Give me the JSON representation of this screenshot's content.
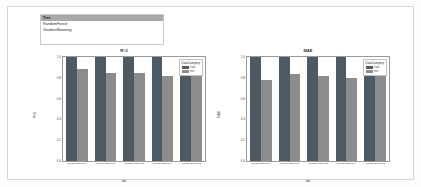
{
  "window": {
    "background_color": "#ffffff",
    "border_color": "#d6d6d6"
  },
  "model_selector": {
    "name": "model-list",
    "options": [
      "Tree",
      "RandomForest",
      "GradientBoosting"
    ],
    "selected": "Tree"
  },
  "legend": {
    "title": "DataCategory",
    "entries": [
      {
        "label": "train",
        "color": "#4c5a66"
      },
      {
        "label": "test",
        "color": "#8c8c8c"
      }
    ]
  },
  "chart_data": [
    {
      "type": "bar",
      "title": "R^2",
      "xlabel": "idx",
      "ylabel": "R^2",
      "ylim": [
        0.0,
        1.0
      ],
      "yticks": [
        "1.0",
        "0.8",
        "0.6",
        "0.4",
        "0.2",
        "0.0"
      ],
      "grid": false,
      "legend_position": "top-right",
      "categories": [
        "Results_20200101",
        "Results_20200102",
        "Results_20200103",
        "Results_20200104",
        "Results_20200105"
      ],
      "series": [
        {
          "name": "train",
          "values": [
            1.0,
            1.0,
            1.0,
            1.0,
            0.92
          ]
        },
        {
          "name": "test",
          "values": [
            0.88,
            0.85,
            0.85,
            0.82,
            0.85
          ]
        }
      ]
    },
    {
      "type": "bar",
      "title": "MAE",
      "xlabel": "idx",
      "ylabel": "MAE",
      "ylim": [
        0.0,
        1.0
      ],
      "yticks": [
        "1.0",
        "0.8",
        "0.6",
        "0.4",
        "0.2",
        "0.0"
      ],
      "grid": false,
      "legend_position": "top-right",
      "categories": [
        "Results_20200101",
        "Results_20200102",
        "Results_20200103",
        "Results_20200104",
        "Results_20200105"
      ],
      "series": [
        {
          "name": "train",
          "values": [
            1.0,
            1.0,
            1.0,
            1.0,
            0.92
          ]
        },
        {
          "name": "test",
          "values": [
            0.78,
            0.84,
            0.82,
            0.8,
            0.84
          ]
        }
      ]
    }
  ]
}
